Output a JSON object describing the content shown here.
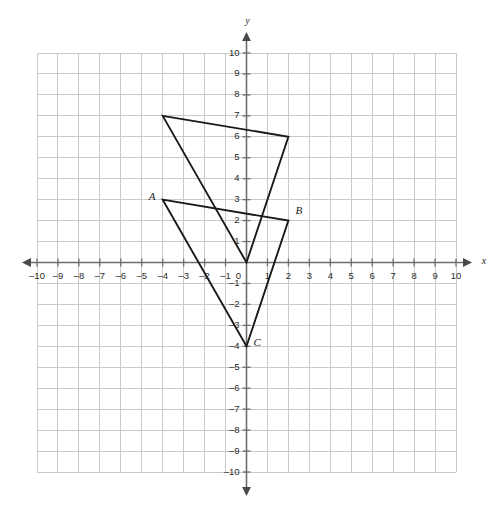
{
  "chart_data": {
    "type": "scatter",
    "title": "",
    "xlabel": "x",
    "ylabel": "y",
    "xlim": [
      -10,
      10
    ],
    "ylim": [
      -10,
      10
    ],
    "grid": true,
    "legend": "none",
    "x_ticks": [
      -10,
      -9,
      -8,
      -7,
      -6,
      -5,
      -4,
      -3,
      -2,
      -1,
      0,
      1,
      2,
      3,
      4,
      5,
      6,
      7,
      8,
      9,
      10
    ],
    "y_ticks": [
      -10,
      -9,
      -8,
      -7,
      -6,
      -5,
      -4,
      -3,
      -2,
      -1,
      1,
      2,
      3,
      4,
      5,
      6,
      7,
      8,
      9,
      10
    ],
    "x_tick_labels": [
      "-10",
      "-9",
      "-8",
      "-7",
      "-6",
      "-5",
      "-4",
      "-3",
      "-2",
      "-1",
      "0",
      "1",
      "2",
      "3",
      "4",
      "5",
      "6",
      "7",
      "8",
      "9",
      "10"
    ],
    "y_tick_labels": [
      "-10",
      "-9",
      "-8",
      "-7",
      "-6",
      "-5",
      "-4",
      "-3",
      "-2",
      "-1",
      "1",
      "2",
      "3",
      "4",
      "5",
      "6",
      "7",
      "8",
      "9",
      "10"
    ],
    "shapes": [
      {
        "name": "triangle-abc",
        "kind": "triangle",
        "vertices": [
          {
            "label": "A",
            "x": -4,
            "y": 3,
            "label_dx": -14,
            "label_dy": -2
          },
          {
            "label": "B",
            "x": 2,
            "y": 2,
            "label_dx": 7,
            "label_dy": -9
          },
          {
            "label": "C",
            "x": 0,
            "y": -4,
            "label_dx": 7,
            "label_dy": -3
          }
        ],
        "stroke": "#1a1a1a"
      },
      {
        "name": "triangle-image",
        "kind": "triangle",
        "vertices": [
          {
            "label": "",
            "x": -4,
            "y": 7,
            "label_dx": 0,
            "label_dy": 0
          },
          {
            "label": "",
            "x": 2,
            "y": 6,
            "label_dx": 0,
            "label_dy": 0
          },
          {
            "label": "",
            "x": 0,
            "y": 0,
            "label_dx": 0,
            "label_dy": 0
          }
        ],
        "stroke": "#1a1a1a"
      }
    ]
  },
  "colors": {
    "grid": "#c9c9c9",
    "axis": "#6e6e6e",
    "shape": "#1a1a1a",
    "background": "#ffffff",
    "text": "#2b2b2b"
  },
  "geometry": {
    "origin_x": 246.5,
    "origin_y": 262.5,
    "unit_px": 20.95,
    "grid_left": -10,
    "grid_right": 10,
    "grid_top": 10,
    "grid_bottom": -10,
    "x_axis_arrow_left": 22,
    "x_axis_arrow_right": 472,
    "y_axis_arrow_top": 32,
    "y_axis_arrow_bottom": 496
  }
}
